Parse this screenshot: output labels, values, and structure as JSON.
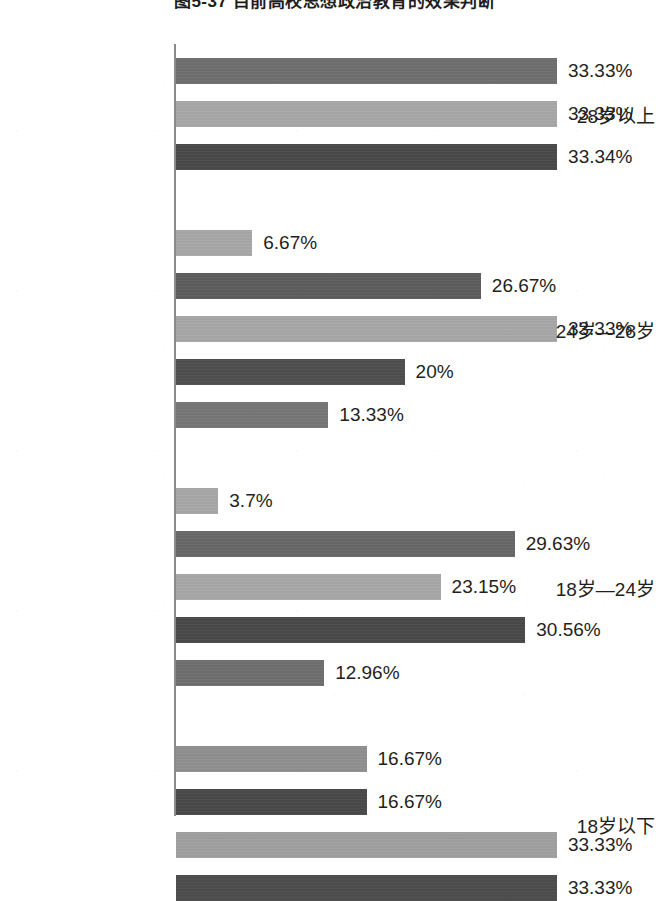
{
  "chart_data": {
    "type": "bar",
    "orientation": "horizontal",
    "title": "图5-37  目前高校思想政治教育的效果判断",
    "xlabel": "",
    "ylabel": "",
    "grid": false,
    "legend": null,
    "axis_max_percent": 35.0,
    "value_suffix": "%",
    "categories": [
      "28岁以上",
      "24岁—28岁",
      "18岁—24岁",
      "18岁以下"
    ],
    "groups": [
      {
        "category": "28岁以上",
        "bars": [
          {
            "value": 33.33,
            "label": "33.33%",
            "color": "#6f6f6f",
            "tone": "medium"
          },
          {
            "value": 33.33,
            "label": "33.33%",
            "color": "#a8a8a8",
            "tone": "light"
          },
          {
            "value": 33.34,
            "label": "33.34%",
            "color": "#4a4a4a",
            "tone": "dark"
          }
        ]
      },
      {
        "category": "24岁—28岁",
        "bars": [
          {
            "value": 6.67,
            "label": "6.67%",
            "color": "#a8a8a8",
            "tone": "light"
          },
          {
            "value": 26.67,
            "label": "26.67%",
            "color": "#5e5e5e",
            "tone": "dark"
          },
          {
            "value": 33.33,
            "label": "33.33%",
            "color": "#a8a8a8",
            "tone": "light"
          },
          {
            "value": 20.0,
            "label": "20%",
            "color": "#4f4f4f",
            "tone": "dark"
          },
          {
            "value": 13.33,
            "label": "13.33%",
            "color": "#777777",
            "tone": "medium"
          }
        ]
      },
      {
        "category": "18岁—24岁",
        "bars": [
          {
            "value": 3.7,
            "label": "3.7%",
            "color": "#a8a8a8",
            "tone": "light"
          },
          {
            "value": 29.63,
            "label": "29.63%",
            "color": "#686868",
            "tone": "medium"
          },
          {
            "value": 23.15,
            "label": "23.15%",
            "color": "#a8a8a8",
            "tone": "light"
          },
          {
            "value": 30.56,
            "label": "30.56%",
            "color": "#4a4a4a",
            "tone": "dark"
          },
          {
            "value": 12.96,
            "label": "12.96%",
            "color": "#6f6f6f",
            "tone": "medium"
          }
        ]
      },
      {
        "category": "18岁以下",
        "bars": [
          {
            "value": 16.67,
            "label": "16.67%",
            "color": "#909090",
            "tone": "medium-light"
          },
          {
            "value": 16.67,
            "label": "16.67%",
            "color": "#4a4a4a",
            "tone": "dark"
          },
          {
            "value": 33.33,
            "label": "33.33%",
            "color": "#a0a0a0",
            "tone": "light"
          },
          {
            "value": 33.33,
            "label": "33.33%",
            "color": "#4d4d4d",
            "tone": "dark"
          }
        ]
      }
    ]
  },
  "layout": {
    "axis_x": 174,
    "axis_top": 44,
    "axis_bottom": 816,
    "bar_origin_x": 176,
    "bar_height": 26,
    "bar_pitch": 43,
    "group_gap": 43,
    "first_bar_top": 58,
    "px_per_percent": 11.43
  }
}
